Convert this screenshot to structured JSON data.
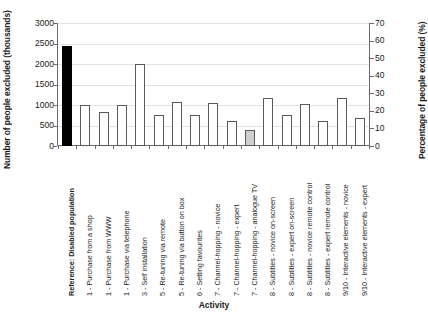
{
  "chart_data": {
    "type": "bar",
    "title": "",
    "xlabel": "Activity",
    "ylabel": "Number of people excluded (thousands)",
    "ylabel_right": "Percentage of people excluded (%)",
    "ylim": [
      0,
      3000
    ],
    "ylim_right": [
      0,
      70
    ],
    "yticks": [
      0,
      500,
      1000,
      1500,
      2000,
      2500,
      3000
    ],
    "yticks_right": [
      0,
      10,
      20,
      30,
      40,
      50,
      60,
      70
    ],
    "grid": true,
    "legend": "none",
    "units": "thousands of people",
    "categories": [
      "Reference: Disabled population",
      "1 - Purchase from a shop",
      "1 - Purchase from WWW",
      "1 - Purchase via telephone",
      "3 - Self installation",
      "5 - Re-tuning via remote",
      "5 - Re-tuning via button on box",
      "6 - Setting favourites",
      "7 - Channel-hopping - novice",
      "7 - Channel-hopping - expert",
      "7 - Channel-hopping - analogue TV",
      "8 - Subtitles - novice on-screen",
      "8 - Subtitles - expert on-screen",
      "8 - Subtitles - novice remote control",
      "8 - Subtitles - expert remote control",
      "9/10 - Interactive elements - novice",
      "9/10 - Interactive elements - expert"
    ],
    "values": [
      2450,
      1000,
      820,
      1010,
      2000,
      750,
      1070,
      750,
      1040,
      620,
      400,
      1160,
      760,
      1020,
      600,
      1160,
      690
    ],
    "values_percent": [
      57.2,
      23.3,
      19.1,
      23.6,
      46.7,
      17.5,
      25.0,
      17.5,
      24.3,
      14.5,
      9.3,
      27.1,
      17.7,
      23.8,
      14.0,
      27.1,
      16.1
    ],
    "bar_styles": [
      "black",
      "white",
      "white",
      "white",
      "white",
      "white",
      "white",
      "white",
      "white",
      "white",
      "grey",
      "white",
      "white",
      "white",
      "white",
      "white",
      "white"
    ],
    "colors": {
      "reference_bar": "#000000",
      "standard_bar": "#ffffff",
      "highlight_bar": "#cfcfcf",
      "bar_outline": "#5a5a5a",
      "axis": "#6b6b6b",
      "gridline": "#e2e2e2",
      "text": "#1a1a1a"
    }
  }
}
